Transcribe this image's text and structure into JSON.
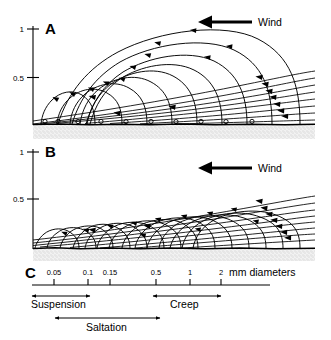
{
  "figure": {
    "background_color": "#ffffff",
    "line_color": "#000000",
    "bed_fill_color": "#e8e8e8"
  },
  "panels": [
    {
      "id": "A",
      "letter": "A",
      "wind_label": "Wind",
      "wind_direction": "right-to-left",
      "y_axis": {
        "ticks": [
          {
            "label": "1",
            "value": 1.0
          },
          {
            "label": "0.5",
            "value": 0.5
          }
        ],
        "max": 1.0,
        "min": 0.0
      },
      "description": "Long, high saltation trajectories of fine grains with steep ascent and long flat descent; wind streamlines converge at right.",
      "trajectory_count": 9,
      "streamline_count": 8,
      "grain_marker_count": 10
    },
    {
      "id": "B",
      "letter": "B",
      "wind_label": "Wind",
      "wind_direction": "right-to-left",
      "y_axis": {
        "ticks": [
          {
            "label": "1",
            "value": 1.0
          },
          {
            "label": "0.5",
            "value": 0.5
          }
        ],
        "max": 1.0,
        "min": 0.0
      },
      "description": "Short, low, densely packed saltation trajectories of coarse grains; wind streamlines converge at right.",
      "trajectory_count": 14,
      "streamline_count": 8,
      "grain_marker_count": 0
    }
  ],
  "scale_panel": {
    "id": "C",
    "letter": "C",
    "units_label": "mm diameters",
    "ticks": [
      {
        "label": "0.05",
        "x": 54
      },
      {
        "label": "0.1",
        "x": 88
      },
      {
        "label": "0.15",
        "x": 110
      },
      {
        "label": "0.5",
        "x": 156
      },
      {
        "label": "1",
        "x": 190
      },
      {
        "label": "2",
        "x": 221
      }
    ],
    "ranges": [
      {
        "label": "Suspension",
        "start_x": 32,
        "end_x": 90,
        "row": 1
      },
      {
        "label": "Creep",
        "start_x": 153,
        "end_x": 221,
        "row": 1
      },
      {
        "label": "Saltation",
        "start_x": 55,
        "end_x": 160,
        "row": 2
      }
    ]
  }
}
